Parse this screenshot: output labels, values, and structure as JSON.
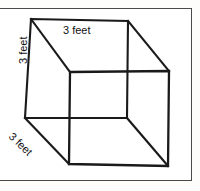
{
  "figure": {
    "shape": "cube",
    "projection": "oblique",
    "stroke_color": "#1a1a1a",
    "frame_color": "#4a4a4a",
    "background_color": "#ffffff",
    "labels": {
      "top_edge": "3 feet",
      "left_edge": "3 feet",
      "depth_edge": "3 feet"
    },
    "measurement": {
      "value": "3",
      "unit": "feet"
    },
    "geometry": {
      "back_face": {
        "top_left": [
          31,
          19
        ],
        "top_right": [
          128,
          21
        ],
        "bottom_right": [
          127,
          118
        ],
        "bottom_left": [
          25,
          118
        ]
      },
      "front_face": {
        "top_left": [
          70,
          72
        ],
        "top_right": [
          169,
          71
        ],
        "bottom_right": [
          168,
          166
        ],
        "bottom_left": [
          69,
          164
        ]
      }
    }
  }
}
